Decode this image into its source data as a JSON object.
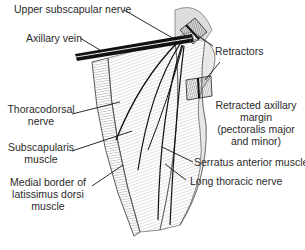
{
  "labels": {
    "upper_subscapular_nerve": "Upper subscapular nerve",
    "axillary_vein": "Axillary vein",
    "retractors": "Retractors",
    "thoracodorsal_nerve_1": "Thoracodorsal",
    "thoracodorsal_nerve_2": "nerve",
    "subscapularis_muscle_1": "Subscapularis",
    "subscapularis_muscle_2": "muscle",
    "medial_border_1": "Medial border of",
    "medial_border_2": "latissimus dorsi",
    "medial_border_3": "muscle",
    "retracted_margin_1": "Retracted axillary",
    "retracted_margin_2": "margin",
    "retracted_margin_3": "(pectoralis major",
    "retracted_margin_4": "and minor)",
    "serratus_anterior": "Serratus anterior muscle",
    "long_thoracic_nerve": "Long thoracic nerve"
  }
}
